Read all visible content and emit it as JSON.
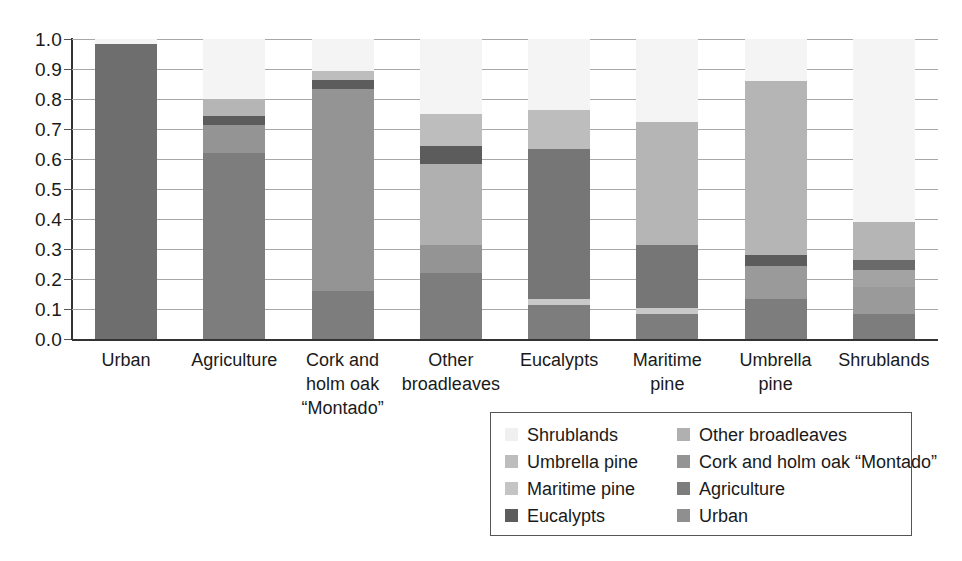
{
  "chart_data": {
    "type": "bar",
    "subtype": "stacked-bar-100",
    "title": "",
    "subtitle": "",
    "xlabel": "",
    "ylabel": "",
    "ylim": [
      0.0,
      1.0
    ],
    "grid": true,
    "legend_position": "bottom-right",
    "ytick_labels": [
      "1.0",
      "0.9",
      "0.8",
      "0.7",
      "0.6",
      "0.5",
      "0.4",
      "0.3",
      "0.2",
      "0.1",
      "0.0"
    ],
    "ytick_values": [
      1.0,
      0.9,
      0.8,
      0.7,
      0.6,
      0.5,
      0.4,
      0.3,
      0.2,
      0.1,
      0.0
    ],
    "categories": [
      "Urban",
      "Agriculture",
      "Cork and holm oak “Montado”",
      "Other broadleaves",
      "Eucalypts",
      "Maritime pine",
      "Umbrella pine",
      "Shrublands"
    ],
    "category_label_lines": [
      [
        "Urban"
      ],
      [
        "Agriculture"
      ],
      [
        "Cork and",
        "holm oak",
        "“Montado”"
      ],
      [
        "Other",
        "broadleaves"
      ],
      [
        "Eucalypts"
      ],
      [
        "Maritime",
        "pine"
      ],
      [
        "Umbrella",
        "pine"
      ],
      [
        "Shrublands"
      ]
    ],
    "series": [
      {
        "name": "Urban",
        "color": "#6e6e6e",
        "values": [
          0.985,
          0.0,
          0.0,
          0.0,
          0.0,
          0.0,
          0.0,
          0.0
        ]
      },
      {
        "name": "Agriculture",
        "color": "#7d7d7d",
        "values": [
          0.0,
          0.62,
          0.16,
          0.22,
          0.115,
          0.085,
          0.135,
          0.085
        ]
      },
      {
        "name": "Cork and holm oak “Montado”",
        "color": "#949494",
        "values": [
          0.0,
          0.095,
          0.675,
          0.095,
          0.0,
          0.0,
          0.0,
          0.055
        ]
      },
      {
        "name": "Other broadleaves",
        "color": "#a8a8a8",
        "values": [
          0.0,
          0.0,
          0.0,
          0.27,
          0.0,
          0.0,
          0.0,
          0.0
        ]
      },
      {
        "name": "Eucalypts",
        "color": "#5c5c5c",
        "values": [
          0.0,
          0.03,
          0.03,
          0.06,
          0.5,
          0.21,
          0.035,
          0.035
        ]
      },
      {
        "name": "Maritime pine",
        "color": "#c4c4c4",
        "values": [
          0.0,
          0.0,
          0.0,
          0.0,
          0.02,
          0.02,
          0.11,
          0.09
        ]
      },
      {
        "name": "Umbrella pine",
        "color": "#b5b5b5",
        "values": [
          0.0,
          0.055,
          0.03,
          0.105,
          0.13,
          0.41,
          0.58,
          0.125
        ]
      },
      {
        "name": "Shrublands",
        "color": "#ededed",
        "values": [
          0.015,
          0.2,
          0.105,
          0.25,
          0.235,
          0.275,
          0.14,
          0.61
        ]
      }
    ],
    "stack_order_bottom_to_top": [
      "Urban",
      "Agriculture",
      "Cork and holm oak “Montado”",
      "Other broadleaves",
      "Eucalypts",
      "Maritime pine",
      "Umbrella pine",
      "Shrublands"
    ],
    "bar_stacks": [
      {
        "category": "Urban",
        "segments": [
          {
            "name": "Urban",
            "value": 0.985,
            "color": "#6e6e6e"
          },
          {
            "name": "Shrublands",
            "value": 0.015,
            "color": "#f4f4f4"
          }
        ]
      },
      {
        "category": "Agriculture",
        "segments": [
          {
            "name": "Agriculture",
            "value": 0.62,
            "color": "#7d7d7d"
          },
          {
            "name": "Cork and holm oak “Montado”",
            "value": 0.095,
            "color": "#949494"
          },
          {
            "name": "Eucalypts",
            "value": 0.03,
            "color": "#5c5c5c"
          },
          {
            "name": "Umbrella pine",
            "value": 0.055,
            "color": "#b5b5b5"
          },
          {
            "name": "Shrublands",
            "value": 0.2,
            "color": "#f4f4f4"
          }
        ]
      },
      {
        "category": "Cork and holm oak “Montado”",
        "segments": [
          {
            "name": "Agriculture",
            "value": 0.16,
            "color": "#7d7d7d"
          },
          {
            "name": "Cork and holm oak “Montado”",
            "value": 0.675,
            "color": "#949494"
          },
          {
            "name": "Eucalypts",
            "value": 0.03,
            "color": "#5c5c5c"
          },
          {
            "name": "Umbrella pine",
            "value": 0.03,
            "color": "#bdbdbd"
          },
          {
            "name": "Shrublands",
            "value": 0.105,
            "color": "#f4f4f4"
          }
        ]
      },
      {
        "category": "Other broadleaves",
        "segments": [
          {
            "name": "Agriculture",
            "value": 0.22,
            "color": "#7d7d7d"
          },
          {
            "name": "Cork and holm oak “Montado”",
            "value": 0.095,
            "color": "#949494"
          },
          {
            "name": "Other broadleaves",
            "value": 0.27,
            "color": "#b0b0b0"
          },
          {
            "name": "Eucalypts",
            "value": 0.06,
            "color": "#5c5c5c"
          },
          {
            "name": "Umbrella pine",
            "value": 0.105,
            "color": "#bdbdbd"
          },
          {
            "name": "Shrublands",
            "value": 0.25,
            "color": "#f4f4f4"
          }
        ]
      },
      {
        "category": "Eucalypts",
        "segments": [
          {
            "name": "Agriculture",
            "value": 0.115,
            "color": "#7d7d7d"
          },
          {
            "name": "Maritime pine",
            "value": 0.02,
            "color": "#c9c9c9"
          },
          {
            "name": "Eucalypts",
            "value": 0.5,
            "color": "#767676"
          },
          {
            "name": "Umbrella pine",
            "value": 0.13,
            "color": "#bdbdbd"
          },
          {
            "name": "Shrublands",
            "value": 0.235,
            "color": "#f4f4f4"
          }
        ]
      },
      {
        "category": "Maritime pine",
        "segments": [
          {
            "name": "Agriculture",
            "value": 0.085,
            "color": "#7d7d7d"
          },
          {
            "name": "Maritime pine",
            "value": 0.02,
            "color": "#c9c9c9"
          },
          {
            "name": "Eucalypts",
            "value": 0.21,
            "color": "#767676"
          },
          {
            "name": "Umbrella pine",
            "value": 0.41,
            "color": "#b5b5b5"
          },
          {
            "name": "Shrublands",
            "value": 0.275,
            "color": "#f4f4f4"
          }
        ]
      },
      {
        "category": "Umbrella pine",
        "segments": [
          {
            "name": "Agriculture",
            "value": 0.135,
            "color": "#7d7d7d"
          },
          {
            "name": "Maritime pine",
            "value": 0.11,
            "color": "#9a9a9a"
          },
          {
            "name": "Eucalypts",
            "value": 0.035,
            "color": "#5c5c5c"
          },
          {
            "name": "Umbrella pine",
            "value": 0.58,
            "color": "#b5b5b5"
          },
          {
            "name": "Shrublands",
            "value": 0.14,
            "color": "#f4f4f4"
          }
        ]
      },
      {
        "category": "Shrublands",
        "segments": [
          {
            "name": "Agriculture",
            "value": 0.085,
            "color": "#7d7d7d"
          },
          {
            "name": "Maritime pine",
            "value": 0.09,
            "color": "#9a9a9a"
          },
          {
            "name": "Cork and holm oak “Montado”",
            "value": 0.055,
            "color": "#a3a3a3"
          },
          {
            "name": "Eucalypts",
            "value": 0.035,
            "color": "#6a6a6a"
          },
          {
            "name": "Umbrella pine",
            "value": 0.125,
            "color": "#b5b5b5"
          },
          {
            "name": "Shrublands",
            "value": 0.61,
            "color": "#f4f4f4"
          }
        ]
      }
    ],
    "legend": {
      "columns": [
        [
          {
            "label": "Shrublands",
            "color": "#f0f0f0"
          },
          {
            "label": "Umbrella pine",
            "color": "#bdbdbd"
          },
          {
            "label": "Maritime pine",
            "color": "#c4c4c4"
          },
          {
            "label": "Eucalypts",
            "color": "#5c5c5c"
          }
        ],
        [
          {
            "label": "Other broadleaves",
            "color": "#b0b0b0"
          },
          {
            "label": "Cork and holm oak “Montado”",
            "color": "#949494"
          },
          {
            "label": "Agriculture",
            "color": "#7d7d7d"
          },
          {
            "label": "Urban",
            "color": "#8f8f8f"
          }
        ]
      ]
    }
  }
}
